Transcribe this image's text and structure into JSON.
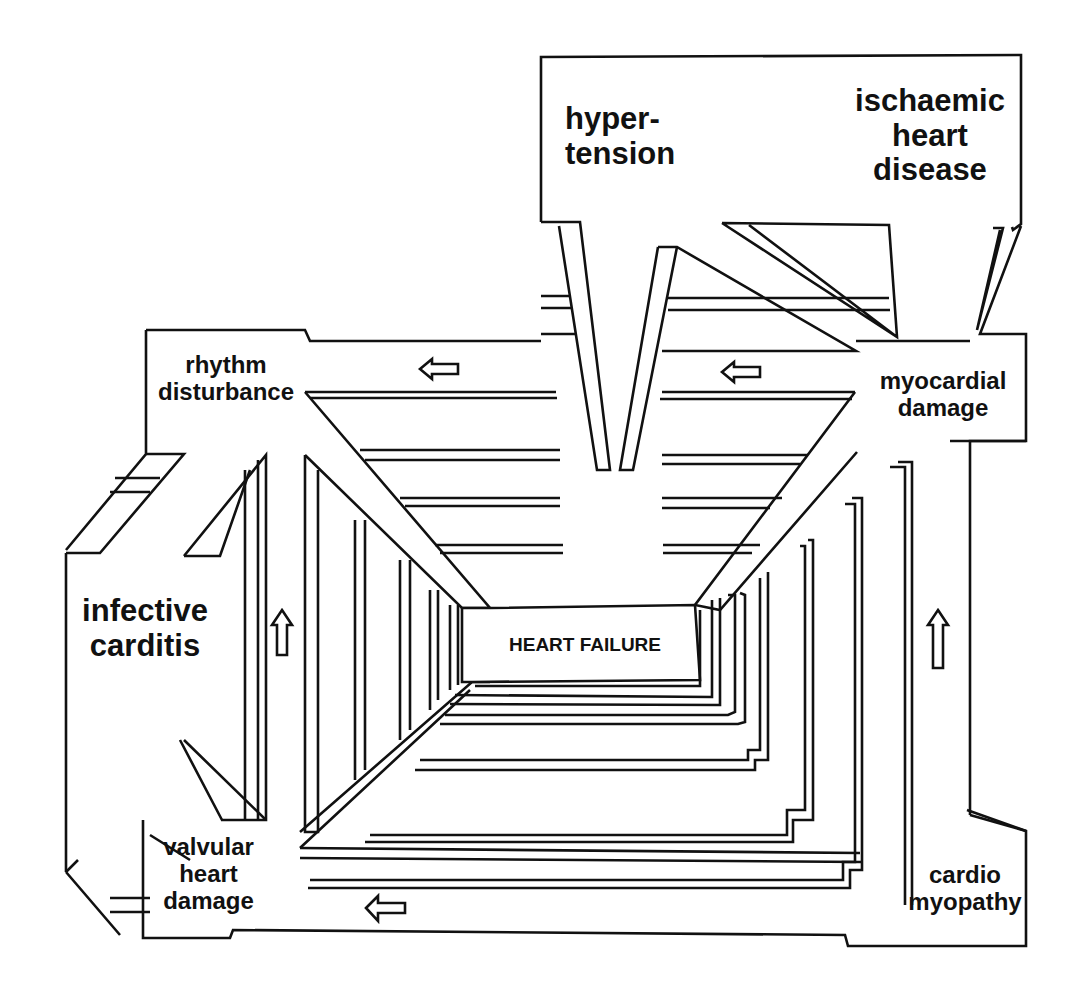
{
  "diagram": {
    "title": "HEART FAILURE",
    "nodes": {
      "hypertension": "hyper-\ntension",
      "ischaemic_heart_disease": "ischaemic\nheart\ndisease",
      "rhythm_disturbance": "rhythm\ndisturbance",
      "myocardial_damage": "myocardial\ndamage",
      "infective_carditis": "infective\ncarditis",
      "valvular_heart_damage": "valvular\nheart\ndamage",
      "cardiomyopathy": "cardio\nmyopathy",
      "center": "HEART FAILURE"
    },
    "arrows": [
      {
        "location": "top-left corridor",
        "direction": "left"
      },
      {
        "location": "top-right corridor",
        "direction": "left"
      },
      {
        "location": "left corridor",
        "direction": "up"
      },
      {
        "location": "right corridor",
        "direction": "up"
      },
      {
        "location": "bottom corridor",
        "direction": "left"
      }
    ],
    "colors": {
      "ink": "#111111",
      "paper": "#ffffff"
    }
  }
}
